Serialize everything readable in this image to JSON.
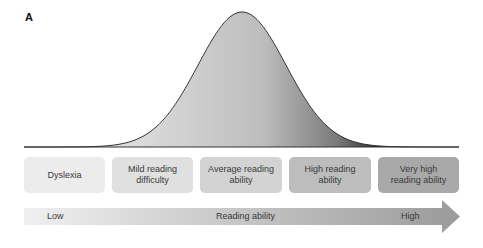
{
  "panel_label": "A",
  "chart_data": {
    "type": "area",
    "title": "",
    "curve": "normal distribution (bell curve)",
    "mean_position": "Average reading ability",
    "categories": [
      "Dyslexia",
      "Mild reading difficulty",
      "Average reading ability",
      "High reading ability",
      "Very high reading ability"
    ],
    "xlabel": "Reading ability",
    "x_low_label": "Low",
    "x_high_label": "High",
    "grid": false,
    "legend": "none"
  },
  "categories": [
    {
      "label": "Dyslexia",
      "color": "#ececec"
    },
    {
      "label": "Mild reading difficulty",
      "color": "#e0e0e0"
    },
    {
      "label": "Average reading ability",
      "color": "#d3d3d3"
    },
    {
      "label": "High reading ability",
      "color": "#bdbdbd"
    },
    {
      "label": "Very high reading ability",
      "color": "#a9a9a9"
    }
  ],
  "arrow": {
    "low": "Low",
    "center": "Reading ability",
    "high": "High"
  }
}
